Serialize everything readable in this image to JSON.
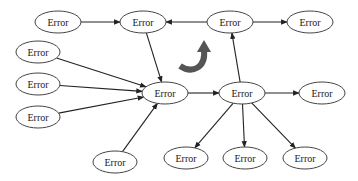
{
  "diagram": {
    "background": "#ffffff",
    "node_stroke": "#444444",
    "edge_color": "#222222",
    "curved_arrow_color": "#555555",
    "nodes": [
      {
        "id": "n1",
        "label": "Error",
        "cx": 58,
        "cy": 22,
        "rx": 23,
        "ry": 11
      },
      {
        "id": "n2",
        "label": "Error",
        "cx": 143,
        "cy": 22,
        "rx": 23,
        "ry": 11
      },
      {
        "id": "n3",
        "label": "Error",
        "cx": 230,
        "cy": 22,
        "rx": 23,
        "ry": 11
      },
      {
        "id": "n4",
        "label": "Error",
        "cx": 310,
        "cy": 22,
        "rx": 23,
        "ry": 11
      },
      {
        "id": "l1",
        "label": "Error",
        "cx": 38,
        "cy": 52,
        "rx": 22,
        "ry": 11
      },
      {
        "id": "l2",
        "label": "Error",
        "cx": 38,
        "cy": 84,
        "rx": 22,
        "ry": 11
      },
      {
        "id": "l3",
        "label": "Error",
        "cx": 38,
        "cy": 117,
        "rx": 22,
        "ry": 11
      },
      {
        "id": "c",
        "label": "Error",
        "cx": 165,
        "cy": 93,
        "rx": 23,
        "ry": 11
      },
      {
        "id": "r",
        "label": "Error",
        "cx": 242,
        "cy": 93,
        "rx": 23,
        "ry": 11
      },
      {
        "id": "r2",
        "label": "Error",
        "cx": 322,
        "cy": 93,
        "rx": 23,
        "ry": 11
      },
      {
        "id": "b1",
        "label": "Error",
        "cx": 115,
        "cy": 162,
        "rx": 22,
        "ry": 11
      },
      {
        "id": "b2",
        "label": "Error",
        "cx": 186,
        "cy": 158,
        "rx": 22,
        "ry": 11
      },
      {
        "id": "b3",
        "label": "Error",
        "cx": 245,
        "cy": 158,
        "rx": 22,
        "ry": 11
      },
      {
        "id": "b4",
        "label": "Error",
        "cx": 305,
        "cy": 158,
        "rx": 22,
        "ry": 11
      }
    ],
    "edges": [
      {
        "from": "n1",
        "to": "n2"
      },
      {
        "from": "n3",
        "to": "n2"
      },
      {
        "from": "n3",
        "to": "n4"
      },
      {
        "from": "n2",
        "to": "c"
      },
      {
        "from": "l1",
        "to": "c"
      },
      {
        "from": "l2",
        "to": "c"
      },
      {
        "from": "l3",
        "to": "c"
      },
      {
        "from": "b1",
        "to": "c"
      },
      {
        "from": "c",
        "to": "r"
      },
      {
        "from": "r",
        "to": "n3"
      },
      {
        "from": "r",
        "to": "r2"
      },
      {
        "from": "r",
        "to": "b2"
      },
      {
        "from": "r",
        "to": "b3"
      },
      {
        "from": "r",
        "to": "b4"
      }
    ],
    "curved_arrow": {
      "direction": "clockwise-up",
      "cx": 193,
      "cy": 58
    }
  }
}
